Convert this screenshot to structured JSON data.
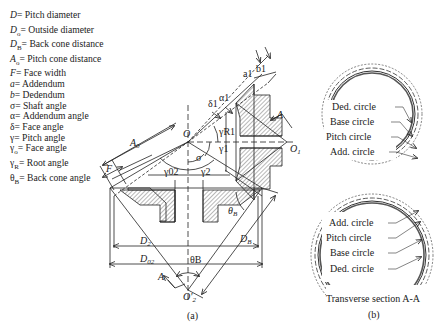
{
  "legend": [
    {
      "symbol": "D",
      "sub": "",
      "text": "= Pitch diameter"
    },
    {
      "symbol": "D",
      "sub": "o",
      "text": "= Outside diameter"
    },
    {
      "symbol": "D",
      "sub": "B",
      "text": "= Back cone distance"
    },
    {
      "symbol": "A",
      "sub": "o",
      "text": "= Pitch cone distance"
    },
    {
      "symbol": "F",
      "sub": "",
      "text": "= Face width"
    },
    {
      "symbol": "a",
      "sub": "",
      "text": "= Addendum"
    },
    {
      "symbol": "b",
      "sub": "",
      "text": "= Dedendum"
    },
    {
      "symbol": "σ",
      "sub": "",
      "text": "= Shaft angle"
    },
    {
      "symbol": "α",
      "sub": "",
      "text": "= Addendum angle"
    },
    {
      "symbol": "δ",
      "sub": "",
      "text": "= Face angle"
    },
    {
      "symbol": "γ",
      "sub": "",
      "text": "= Pitch angle"
    },
    {
      "symbol": "γ",
      "sub": "o",
      "text": "= Face angle"
    },
    {
      "symbol": "γ",
      "sub": "R",
      "text": "= Root angle"
    },
    {
      "symbol": "θ",
      "sub": "B",
      "text": "= Back cone angle"
    }
  ],
  "diagram_a": {
    "caption": "(a)",
    "labels": {
      "O": "O",
      "O1": "O",
      "O1_sub": "1",
      "O2": "O'",
      "O2_sub": "2",
      "A0": "A",
      "A0_sub": "0",
      "F": "F",
      "a1": "a1",
      "b1": "b1",
      "alpha1": "α1",
      "delta1": "δ1",
      "gammaR1": "γR1",
      "gamma1": "γ1",
      "sigma": "σ",
      "gamma02": "γ02",
      "gamma2": "γ2",
      "thetaB_small": "θ",
      "thetaB_small_sub": "B",
      "thetaB": "θB",
      "D2": "D",
      "D2_sub": "2",
      "D02": "D",
      "D02_sub": "02",
      "DB": "D",
      "DB_sub": "B",
      "A_top": "A",
      "A_bottom": "A"
    }
  },
  "diagram_b": {
    "caption": "(b)",
    "title": "Transverse section A-A",
    "upper_labels": [
      "Ded. circle",
      "Base circle",
      "Pitch circle",
      "Add. circle"
    ],
    "lower_labels": [
      "Add. circle",
      "Pitch circle",
      "Base circle",
      "Ded. circle"
    ]
  }
}
